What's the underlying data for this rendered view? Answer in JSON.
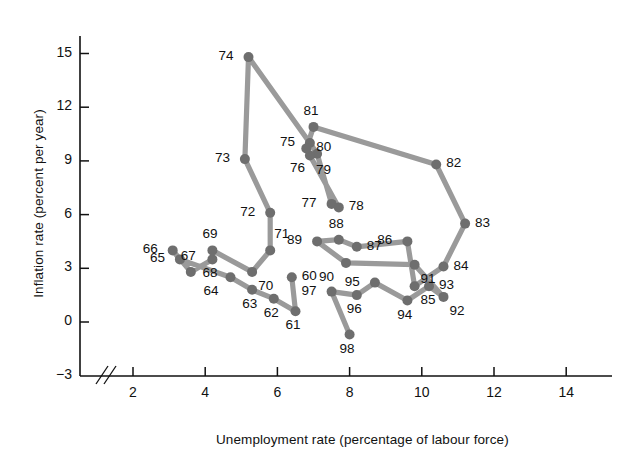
{
  "chart_data": {
    "type": "line",
    "title": "",
    "xlabel": "Unemployment rate (percentage of labour force)",
    "ylabel": "Inflation rate (percent per year)",
    "xlim": [
      1.0,
      15.2
    ],
    "ylim": [
      -3,
      16.2
    ],
    "xticks": [
      2,
      4,
      6,
      8,
      10,
      12,
      14
    ],
    "xtick_labels": [
      "2",
      "4",
      "6",
      "8",
      "10",
      "12",
      "14"
    ],
    "yticks": [
      -3,
      0,
      3,
      6,
      9,
      12,
      15
    ],
    "ytick_labels": [
      "-3",
      "0",
      "3",
      "6",
      "9",
      "12",
      "15"
    ],
    "grid": false,
    "legend": "none",
    "axis_break_x": true,
    "marker_color": "#6e6e6e",
    "line_color": "#9a9a9a",
    "series": [
      {
        "name": "UK unemployment vs inflation 1960-1998",
        "point_label_field": "year",
        "x": [
          6.4,
          6.5,
          5.9,
          5.3,
          4.7,
          3.3,
          3.1,
          3.6,
          4.2,
          4.2,
          5.3,
          5.8,
          5.8,
          5.1,
          5.2,
          6.9,
          7.1,
          7.5,
          7.7,
          6.9,
          6.8,
          7.0,
          10.4,
          11.2,
          10.6,
          9.8,
          9.6,
          8.2,
          7.7,
          7.1,
          7.9,
          9.8,
          10.6,
          10.2,
          9.6,
          8.7,
          8.2,
          7.5,
          8.0
        ],
        "y": [
          2.5,
          0.6,
          1.3,
          1.8,
          2.5,
          3.5,
          4.0,
          2.8,
          3.5,
          4.0,
          2.8,
          4.0,
          6.1,
          9.1,
          14.8,
          10.0,
          9.4,
          6.6,
          6.4,
          9.3,
          9.7,
          10.9,
          8.8,
          5.5,
          3.1,
          2.0,
          4.5,
          4.2,
          4.6,
          4.5,
          3.3,
          3.2,
          1.4,
          2.0,
          1.2,
          2.2,
          1.5,
          1.7,
          -0.7
        ],
        "year": [
          "60",
          "61",
          "62",
          "63",
          "64",
          "65",
          "66",
          "67",
          "68",
          "69",
          "70",
          "71",
          "72",
          "73",
          "74",
          "75",
          "76",
          "77",
          "78",
          "79",
          "80",
          "81",
          "82",
          "83",
          "84",
          "85",
          "86",
          "87",
          "88",
          "89",
          "90",
          "91",
          "92",
          "93",
          "94",
          "95",
          "96",
          "97",
          "98"
        ],
        "label_pos": [
          "right",
          "below",
          "below",
          "below",
          "below-left",
          "left",
          "left",
          "above",
          "below",
          "above",
          "below-right",
          "above-right",
          "left",
          "left",
          "left",
          "left",
          "below-left",
          "left",
          "right",
          "below-right",
          "right",
          "above",
          "right",
          "right",
          "right",
          "below-right",
          "left",
          "right",
          "above",
          "left",
          "below-left",
          "below-right",
          "below-right",
          "right",
          "below",
          "left",
          "below",
          "left",
          "below"
        ]
      }
    ]
  }
}
